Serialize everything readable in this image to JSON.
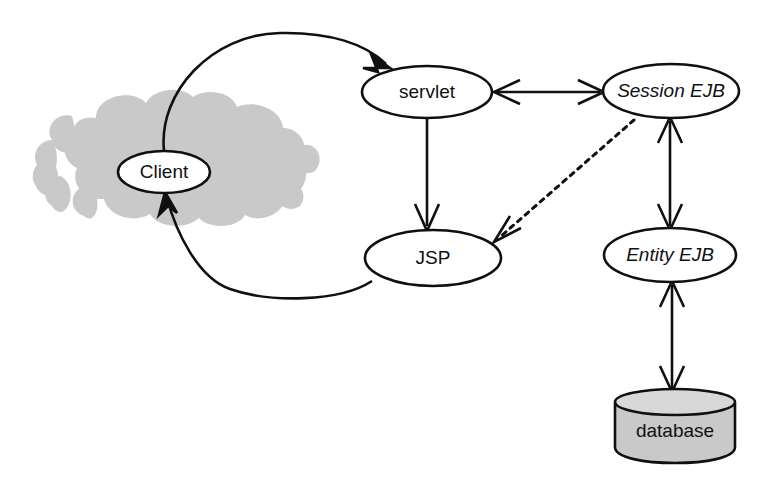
{
  "diagram": {
    "background_color": "#ffffff",
    "stroke_color": "#101010",
    "fill_gray": "#c9c9c9",
    "nodes": [
      {
        "id": "client",
        "label": "Client",
        "shape": "ellipse",
        "italic": false,
        "cx": 164,
        "cy": 172,
        "rx": 46,
        "ry": 21
      },
      {
        "id": "servlet",
        "label": "servlet",
        "shape": "ellipse",
        "italic": false,
        "cx": 427,
        "cy": 92,
        "rx": 65,
        "ry": 26
      },
      {
        "id": "session-ejb",
        "label": "Session EJB",
        "shape": "ellipse",
        "italic": true,
        "cx": 671,
        "cy": 91,
        "rx": 68,
        "ry": 27
      },
      {
        "id": "jsp",
        "label": "JSP",
        "shape": "ellipse",
        "italic": false,
        "cx": 433,
        "cy": 258,
        "rx": 68,
        "ry": 28
      },
      {
        "id": "entity-ejb",
        "label": "Entity EJB",
        "shape": "ellipse",
        "italic": true,
        "cx": 670,
        "cy": 255,
        "rx": 66,
        "ry": 27
      },
      {
        "id": "database",
        "label": "database",
        "shape": "cylinder",
        "italic": false,
        "cx": 675,
        "cy": 424,
        "rx": 60,
        "ry": 33
      },
      {
        "id": "network-cloud",
        "label": "",
        "shape": "cloud",
        "italic": false,
        "cx": 166,
        "cy": 161,
        "rx": 134,
        "ry": 67
      }
    ],
    "edges": [
      {
        "id": "client-to-servlet",
        "from": "client",
        "to": "servlet",
        "style": "solid",
        "arrows": "end",
        "shape": "curve"
      },
      {
        "id": "servlet-to-session-ejb",
        "from": "servlet",
        "to": "session-ejb",
        "style": "solid",
        "arrows": "both",
        "shape": "straight"
      },
      {
        "id": "servlet-to-jsp",
        "from": "servlet",
        "to": "jsp",
        "style": "solid",
        "arrows": "end",
        "shape": "straight"
      },
      {
        "id": "session-ejb-to-jsp",
        "from": "session-ejb",
        "to": "jsp",
        "style": "dashed",
        "arrows": "end",
        "shape": "straight"
      },
      {
        "id": "session-ejb-to-entity-ejb",
        "from": "session-ejb",
        "to": "entity-ejb",
        "style": "solid",
        "arrows": "both",
        "shape": "straight"
      },
      {
        "id": "entity-ejb-to-database",
        "from": "entity-ejb",
        "to": "database",
        "style": "solid",
        "arrows": "both",
        "shape": "straight"
      },
      {
        "id": "jsp-to-client",
        "from": "jsp",
        "to": "client",
        "style": "solid",
        "arrows": "end",
        "shape": "curve"
      }
    ]
  }
}
